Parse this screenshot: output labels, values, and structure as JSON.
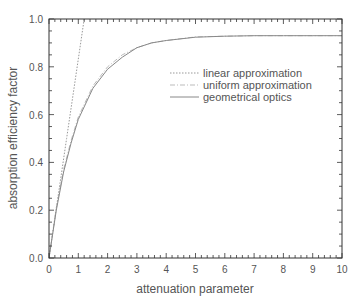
{
  "chart_data": {
    "type": "line",
    "title": "",
    "xlabel": "attenuation parameter",
    "ylabel": "absorption efficiency factor",
    "xlim": [
      0,
      10
    ],
    "ylim": [
      0.0,
      1.0
    ],
    "x_ticks": [
      0,
      1,
      2,
      3,
      4,
      5,
      6,
      7,
      8,
      9,
      10
    ],
    "y_ticks": [
      "0.0",
      "0.2",
      "0.4",
      "0.6",
      "0.8",
      "1.0"
    ],
    "grid": false,
    "legend_position": "upper right (inside)",
    "series": [
      {
        "name": "linear approximation",
        "style": "dotted",
        "x": [
          0,
          0.3,
          0.6,
          0.9,
          1.2
        ],
        "y": [
          0,
          0.25,
          0.5,
          0.75,
          1.0
        ]
      },
      {
        "name": "uniform approximation",
        "style": "dash-dot",
        "x": [
          0,
          0.25,
          0.5,
          0.75,
          1,
          1.5,
          2,
          2.5,
          3,
          3.5,
          4,
          5,
          6,
          7,
          8,
          9,
          10
        ],
        "y": [
          0,
          0.21,
          0.37,
          0.49,
          0.59,
          0.72,
          0.8,
          0.85,
          0.88,
          0.9,
          0.91,
          0.925,
          0.928,
          0.93,
          0.93,
          0.93,
          0.93
        ]
      },
      {
        "name": "geometrical optics",
        "style": "solid",
        "x": [
          0,
          0.25,
          0.5,
          0.75,
          1,
          1.5,
          2,
          2.5,
          3,
          3.5,
          4,
          5,
          6,
          7,
          8,
          9,
          10
        ],
        "y": [
          0,
          0.2,
          0.36,
          0.48,
          0.58,
          0.71,
          0.79,
          0.84,
          0.88,
          0.9,
          0.91,
          0.924,
          0.928,
          0.93,
          0.93,
          0.93,
          0.93
        ]
      }
    ]
  },
  "colors": {
    "axis": "#333333",
    "linear": "#999999",
    "uniform": "#aaaaaa",
    "geometrical": "#888888",
    "text": "#555555"
  }
}
